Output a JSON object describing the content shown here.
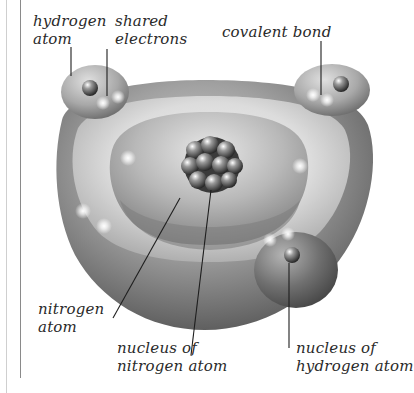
{
  "figure": {
    "labels": {
      "hydrogen_atom": {
        "line1": "hydrogen",
        "line2": "atom"
      },
      "shared_electrons": {
        "line1": "shared",
        "line2": "electrons"
      },
      "covalent_bond": {
        "line1": "covalent bond"
      },
      "nitrogen_atom": {
        "line1": "nitrogen",
        "line2": "atom"
      },
      "nucleus_nitrogen": {
        "line1": "nucleus of",
        "line2": "nitrogen atom"
      },
      "nucleus_hydrogen": {
        "line1": "nucleus of",
        "line2": "hydrogen atom"
      }
    },
    "colors": {
      "shell_dark": "#4a4a4a",
      "shell_mid": "#8c8c8c",
      "shell_light": "#e6e6e6",
      "text": "#2a2a2a",
      "leader_line": "#1e1e1e"
    }
  }
}
